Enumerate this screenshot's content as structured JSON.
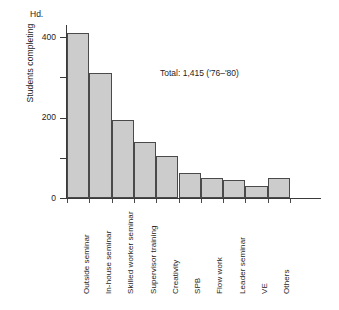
{
  "chart_data": {
    "type": "bar",
    "title": "",
    "subtitle": "",
    "xlabel": "",
    "ylabel": "Students completing",
    "yunit": "Hd.",
    "ylim": [
      0,
      430
    ],
    "yticks": [
      0,
      100,
      200,
      300,
      400
    ],
    "ytick_labels": [
      "0",
      "",
      "200",
      "",
      "400"
    ],
    "grid": false,
    "legend": null,
    "annotation": "Total: 1,415 ('76–'80)",
    "categories": [
      "Outside seminar",
      "In-house seminar",
      "Skilled worker seminar",
      "Supervisor training",
      "Creativity",
      "SPB",
      "Flow work",
      "Leader seminar",
      "VE",
      "Others"
    ],
    "values": [
      410,
      310,
      193,
      140,
      105,
      62,
      50,
      45,
      30,
      50
    ],
    "bar_fill": "#cccccc",
    "bar_stroke": "#4a4a4a",
    "axis_color": "#3a3a3a"
  }
}
